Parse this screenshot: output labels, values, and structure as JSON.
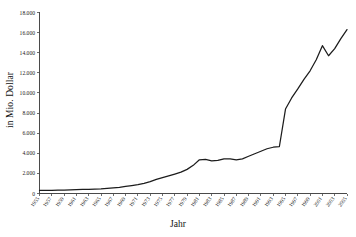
{
  "chart_data": {
    "type": "line",
    "title": "",
    "xlabel": "Jahr",
    "ylabel": "in Mio. Dollar",
    "grid": false,
    "legend": "none",
    "ylim": [
      0,
      18000
    ],
    "ytick_labels": [
      "0",
      "2.000",
      "4.000",
      "6.000",
      "8.000",
      "10.000",
      "12.000",
      "14.000",
      "16.000",
      "18.000"
    ],
    "ytick_values": [
      0,
      2000,
      4000,
      6000,
      8000,
      10000,
      12000,
      14000,
      16000,
      18000
    ],
    "xlim": [
      1955,
      2005
    ],
    "xtick_labels": [
      "1955",
      "1957",
      "1959",
      "1961",
      "1963",
      "1965",
      "1967",
      "1969",
      "1971",
      "1973",
      "1975",
      "1977",
      "1979",
      "1981",
      "1983",
      "1985",
      "1987",
      "1989",
      "1991",
      "1993",
      "1995",
      "1997",
      "1999",
      "2001",
      "2003",
      "2005"
    ],
    "x": [
      1955,
      1956,
      1957,
      1958,
      1959,
      1960,
      1961,
      1962,
      1963,
      1964,
      1965,
      1966,
      1967,
      1968,
      1969,
      1970,
      1971,
      1972,
      1973,
      1974,
      1975,
      1976,
      1977,
      1978,
      1979,
      1980,
      1981,
      1982,
      1983,
      1984,
      1985,
      1986,
      1987,
      1988,
      1989,
      1990,
      1991,
      1992,
      1993,
      1994,
      1995,
      1996,
      1997,
      1998,
      1999,
      2000,
      2001,
      2002,
      2003,
      2004,
      2005
    ],
    "values": [
      300,
      310,
      320,
      330,
      340,
      360,
      380,
      400,
      420,
      440,
      470,
      520,
      570,
      620,
      700,
      790,
      880,
      1000,
      1180,
      1400,
      1580,
      1750,
      1930,
      2120,
      2400,
      2800,
      3350,
      3400,
      3250,
      3300,
      3450,
      3450,
      3350,
      3450,
      3700,
      3950,
      4200,
      4450,
      4600,
      4650,
      8400,
      9500,
      10400,
      11350,
      12200,
      13300,
      14700,
      13700,
      14400,
      15400,
      16300
    ],
    "series": [
      {
        "name": "Wert",
        "values": [
          300,
          310,
          320,
          330,
          340,
          360,
          380,
          400,
          420,
          440,
          470,
          520,
          570,
          620,
          700,
          790,
          880,
          1000,
          1180,
          1400,
          1580,
          1750,
          1930,
          2120,
          2400,
          2800,
          3350,
          3400,
          3250,
          3300,
          3450,
          3450,
          3350,
          3450,
          3700,
          3950,
          4200,
          4450,
          4600,
          4650,
          8400,
          9500,
          10400,
          11350,
          12200,
          13300,
          14700,
          13700,
          14400,
          15400,
          16300
        ]
      }
    ]
  },
  "axis": {
    "y_title": "in Mio. Dollar",
    "x_title": "Jahr"
  }
}
